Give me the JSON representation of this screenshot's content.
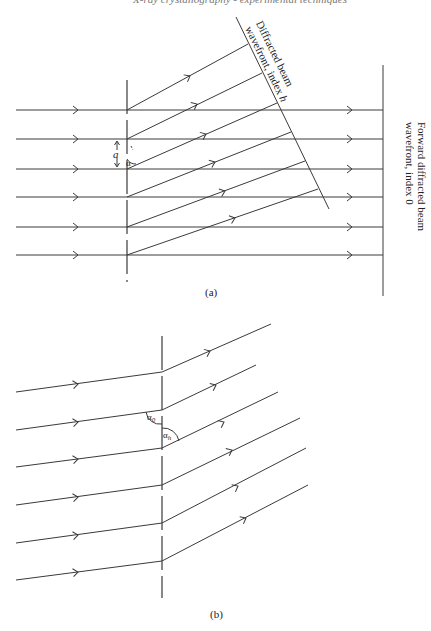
{
  "header_partial": "X-ray crystallography - experimental techniques",
  "panel_a": {
    "caption": "(a)",
    "diffracted_label_line1": "Diffracted beam",
    "diffracted_label_line2": "wavefront, index ",
    "diffracted_label_index": "h",
    "forward_label_line1": "Forward diffracted beam",
    "forward_label_line2": "wavefront, index 0",
    "spacing_label": "a",
    "angle_label": "α",
    "incident_rays_y": [
      110,
      139,
      169,
      197,
      227,
      255
    ],
    "grating_x": 127,
    "forward_wavefront_x": 383
  },
  "panel_b": {
    "caption": "(b)",
    "angle_in_label": "α",
    "angle_in_sub": "0",
    "angle_out_label": "α",
    "angle_out_sub": "h",
    "grating_x": 162
  },
  "colors": {
    "line": "#3a3a3a",
    "text": "#222222",
    "background": "#ffffff"
  }
}
